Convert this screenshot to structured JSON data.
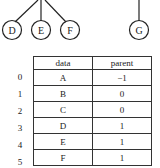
{
  "tree": {
    "nodes": [
      {
        "label": "D",
        "cx": 12,
        "cy": 30
      },
      {
        "label": "E",
        "cx": 41,
        "cy": 30
      },
      {
        "label": "F",
        "cx": 70,
        "cy": 30
      },
      {
        "label": "G",
        "cx": 139,
        "cy": 30
      }
    ],
    "edges": [
      {
        "from": "parent-B",
        "to": "D"
      },
      {
        "from": "parent-B",
        "to": "E"
      },
      {
        "from": "parent-B",
        "to": "F"
      },
      {
        "from": "parent-C",
        "to": "G"
      }
    ]
  },
  "table": {
    "headers": [
      "data",
      "parent"
    ],
    "rows": [
      {
        "index": "0",
        "data": "A",
        "parent": "−1"
      },
      {
        "index": "1",
        "data": "B",
        "parent": "0"
      },
      {
        "index": "2",
        "data": "C",
        "parent": "0"
      },
      {
        "index": "3",
        "data": "D",
        "parent": "1"
      },
      {
        "index": "4",
        "data": "E",
        "parent": "1"
      },
      {
        "index": "5",
        "data": "F",
        "parent": "1"
      }
    ]
  }
}
